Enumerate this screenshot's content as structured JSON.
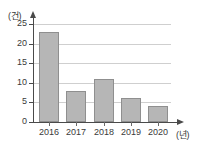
{
  "chart_data": {
    "type": "bar",
    "title": "",
    "xlabel": "(년)",
    "ylabel": "(건)",
    "categories": [
      "2016",
      "2017",
      "2018",
      "2019",
      "2020"
    ],
    "values": [
      23,
      8,
      11,
      6,
      4
    ],
    "series": [
      {
        "name": "건수",
        "values": [
          23,
          8,
          11,
          6,
          4
        ]
      }
    ],
    "ylim": [
      0,
      25
    ],
    "ytick_labels": [
      "0",
      "5",
      "10",
      "15",
      "20",
      "25"
    ],
    "ytick_values": [
      0,
      5,
      10,
      15,
      20,
      25
    ],
    "grid": true,
    "legend": "none",
    "bar_color": "#b6b6b6",
    "bar_border_color": "#8f8f8f",
    "axis_color": "#4a4a4a",
    "grid_color": "#cfcfcf",
    "background": "#ffffff"
  }
}
